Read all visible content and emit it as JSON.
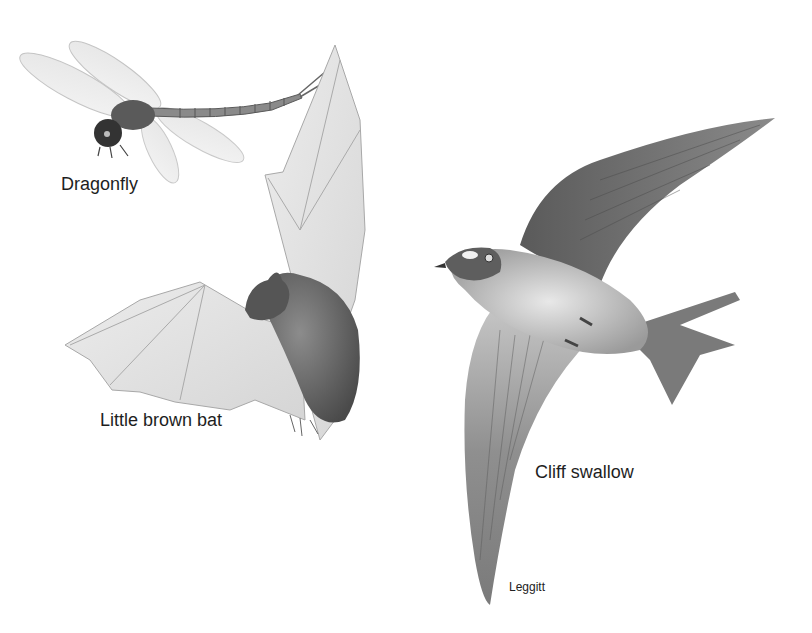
{
  "figure": {
    "labels": {
      "dragonfly": "Dragonfly",
      "bat": "Little brown bat",
      "swallow": "Cliff swallow"
    },
    "credit": "Leggitt"
  },
  "colors": {
    "background": "#ffffff",
    "text": "#1e1e1e",
    "dark_shade": "#3a3a3a",
    "mid_shade": "#7a7a7a",
    "light_shade": "#d6d6d6"
  }
}
